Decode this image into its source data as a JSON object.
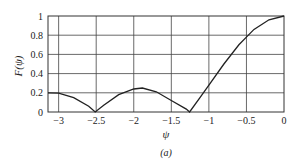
{
  "chart_data": {
    "type": "line",
    "title": "",
    "xlabel": "ψ",
    "ylabel": "F(ψ)",
    "caption": "(a)",
    "xlim": [
      -3.1416,
      0
    ],
    "ylim": [
      0,
      1
    ],
    "grid": true,
    "legend": null,
    "x_ticks": [
      -3,
      -2.5,
      -2,
      -1.5,
      -1,
      -0.5,
      0
    ],
    "x_tick_labels": [
      "−3",
      "−2.5",
      "−2",
      "−1.5",
      "−1",
      "−0.5",
      "0"
    ],
    "y_ticks": [
      0,
      0.2,
      0.4,
      0.6,
      0.8,
      1
    ],
    "y_tick_labels": [
      "0",
      "0.2",
      "0.4",
      "0.6",
      "0.8",
      "1"
    ],
    "series": [
      {
        "name": "F(ψ)",
        "x": [
          -3.1416,
          -3.0,
          -2.8,
          -2.6,
          -2.513,
          -2.4,
          -2.2,
          -2.0,
          -1.885,
          -1.7,
          -1.5,
          -1.3,
          -1.257,
          -1.1,
          -1.0,
          -0.8,
          -0.6,
          -0.5,
          -0.4,
          -0.2,
          0
        ],
        "values": [
          0.2,
          0.196,
          0.15,
          0.06,
          0.0,
          0.07,
          0.18,
          0.24,
          0.25,
          0.21,
          0.12,
          0.03,
          0.0,
          0.17,
          0.28,
          0.5,
          0.7,
          0.78,
          0.86,
          0.96,
          1.0
        ]
      }
    ],
    "color": "#222222"
  }
}
